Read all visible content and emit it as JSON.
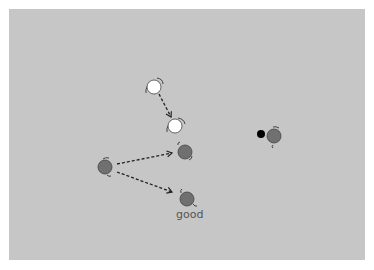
{
  "diagram": {
    "panel_color": "#c6c6c6",
    "robots": [
      {
        "id": "white-start",
        "cx": 154,
        "cy": 87,
        "fill": "#ffffff"
      },
      {
        "id": "white-end",
        "cx": 175,
        "cy": 126,
        "fill": "#ffffff"
      },
      {
        "id": "gray-target-upper",
        "cx": 185,
        "cy": 152,
        "fill": "#707070"
      },
      {
        "id": "gray-source",
        "cx": 105,
        "cy": 167,
        "fill": "#707070"
      },
      {
        "id": "gray-target-good",
        "cx": 187,
        "cy": 199,
        "fill": "#707070"
      },
      {
        "id": "gray-right",
        "cx": 274,
        "cy": 136,
        "fill": "#707070"
      }
    ],
    "black_dot": {
      "cx": 261,
      "cy": 134,
      "r": 4,
      "fill": "#000000"
    },
    "arrows": [
      {
        "from": "white-start",
        "to": "white-end",
        "x1": 159,
        "y1": 94,
        "x2": 171,
        "y2": 117
      },
      {
        "from": "gray-source",
        "to": "gray-target-upper",
        "x1": 117,
        "y1": 164,
        "x2": 172,
        "y2": 153
      },
      {
        "from": "gray-source",
        "to": "gray-target-good",
        "x1": 117,
        "y1": 172,
        "x2": 172,
        "y2": 192
      }
    ],
    "labels": {
      "good": "good"
    }
  }
}
